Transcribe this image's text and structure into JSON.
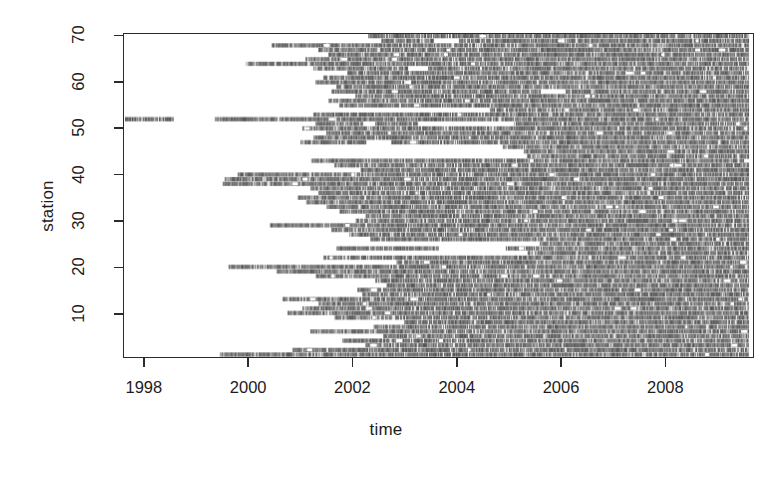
{
  "chart_data": {
    "type": "heatmap",
    "title": "",
    "xlabel": "time",
    "ylabel": "station",
    "xlim": [
      1997.6,
      2009.7
    ],
    "ylim": [
      0.5,
      70.5
    ],
    "grid": false,
    "legend": "none",
    "xticks": [
      1998,
      2000,
      2002,
      2004,
      2006,
      2008
    ],
    "xtick_labels": [
      "1998",
      "2000",
      "2002",
      "2004",
      "2006",
      "2008"
    ],
    "yticks": [
      10,
      20,
      30,
      40,
      50,
      60,
      70
    ],
    "ytick_labels": [
      "10",
      "20",
      "30",
      "40",
      "50",
      "60",
      "70"
    ],
    "fill_color": "#808080",
    "background_color": "#ffffff",
    "axis_color": "#2b2b2b",
    "n_stations": 70,
    "station_records": [
      {
        "station": 70,
        "segments": [
          [
            2002.3,
            2009.62
          ]
        ]
      },
      {
        "station": 69,
        "segments": [
          [
            2002.55,
            2003.55
          ],
          [
            2004.05,
            2009.62
          ]
        ]
      },
      {
        "station": 68,
        "segments": [
          [
            2000.45,
            2009.62
          ]
        ]
      },
      {
        "station": 67,
        "segments": [
          [
            2001.35,
            2009.62
          ]
        ]
      },
      {
        "station": 66,
        "segments": [
          [
            2001.55,
            2009.62
          ]
        ]
      },
      {
        "station": 65,
        "segments": [
          [
            2001.1,
            2009.62
          ]
        ]
      },
      {
        "station": 64,
        "segments": [
          [
            1999.95,
            2009.62
          ]
        ]
      },
      {
        "station": 63,
        "segments": [
          [
            2001.25,
            2003.05
          ],
          [
            2003.45,
            2009.62
          ]
        ]
      },
      {
        "station": 62,
        "segments": [
          [
            2001.9,
            2009.62
          ]
        ]
      },
      {
        "station": 61,
        "segments": [
          [
            2001.45,
            2009.62
          ]
        ]
      },
      {
        "station": 60,
        "segments": [
          [
            2001.3,
            2009.62
          ]
        ]
      },
      {
        "station": 59,
        "segments": [
          [
            2001.7,
            2009.62
          ]
        ]
      },
      {
        "station": 58,
        "segments": [
          [
            2001.6,
            2005.6
          ],
          [
            2006.1,
            2009.62
          ]
        ]
      },
      {
        "station": 57,
        "segments": [
          [
            2002.05,
            2009.62
          ]
        ]
      },
      {
        "station": 56,
        "segments": [
          [
            2001.55,
            2009.62
          ]
        ]
      },
      {
        "station": 55,
        "segments": [
          [
            2001.75,
            2009.62
          ]
        ]
      },
      {
        "station": 54,
        "segments": [
          [
            2004.65,
            2009.62
          ]
        ]
      },
      {
        "station": 53,
        "segments": [
          [
            2001.25,
            2009.62
          ]
        ]
      },
      {
        "station": 52,
        "segments": [
          [
            1997.62,
            1998.55
          ],
          [
            1999.35,
            2009.62
          ]
        ]
      },
      {
        "station": 51,
        "segments": [
          [
            2001.3,
            2002.2
          ],
          [
            2002.45,
            2003.25
          ],
          [
            2005.1,
            2009.62
          ]
        ]
      },
      {
        "station": 50,
        "segments": [
          [
            2001.05,
            2009.62
          ]
        ]
      },
      {
        "station": 49,
        "segments": [
          [
            2001.5,
            2009.62
          ]
        ]
      },
      {
        "station": 48,
        "segments": [
          [
            2001.25,
            2009.62
          ]
        ]
      },
      {
        "station": 47,
        "segments": [
          [
            2001.0,
            2002.25
          ],
          [
            2002.75,
            2009.62
          ]
        ]
      },
      {
        "station": 46,
        "segments": [
          [
            2004.9,
            2009.62
          ]
        ]
      },
      {
        "station": 45,
        "segments": [
          [
            2005.3,
            2009.62
          ]
        ]
      },
      {
        "station": 44,
        "segments": [
          [
            2005.35,
            2009.62
          ]
        ]
      },
      {
        "station": 43,
        "segments": [
          [
            2001.2,
            2009.62
          ]
        ]
      },
      {
        "station": 42,
        "segments": [
          [
            2001.65,
            2009.62
          ]
        ]
      },
      {
        "station": 41,
        "segments": [
          [
            2002.15,
            2009.62
          ]
        ]
      },
      {
        "station": 40,
        "segments": [
          [
            1999.8,
            2009.62
          ]
        ]
      },
      {
        "station": 39,
        "segments": [
          [
            1999.55,
            2009.62
          ]
        ]
      },
      {
        "station": 38,
        "segments": [
          [
            1999.5,
            2009.62
          ]
        ]
      },
      {
        "station": 37,
        "segments": [
          [
            2001.2,
            2009.62
          ]
        ]
      },
      {
        "station": 36,
        "segments": [
          [
            2001.35,
            2009.62
          ]
        ]
      },
      {
        "station": 35,
        "segments": [
          [
            2000.95,
            2009.62
          ]
        ]
      },
      {
        "station": 34,
        "segments": [
          [
            2001.1,
            2009.62
          ]
        ]
      },
      {
        "station": 33,
        "segments": [
          [
            2001.5,
            2009.62
          ]
        ]
      },
      {
        "station": 32,
        "segments": [
          [
            2001.75,
            2009.62
          ]
        ]
      },
      {
        "station": 31,
        "segments": [
          [
            2002.25,
            2009.62
          ]
        ]
      },
      {
        "station": 30,
        "segments": [
          [
            2002.05,
            2009.62
          ]
        ]
      },
      {
        "station": 29,
        "segments": [
          [
            2000.4,
            2009.62
          ]
        ]
      },
      {
        "station": 28,
        "segments": [
          [
            2001.6,
            2009.62
          ]
        ]
      },
      {
        "station": 27,
        "segments": [
          [
            2001.95,
            2009.62
          ]
        ]
      },
      {
        "station": 26,
        "segments": [
          [
            2002.35,
            2009.62
          ]
        ]
      },
      {
        "station": 25,
        "segments": [
          [
            2005.6,
            2009.62
          ]
        ]
      },
      {
        "station": 24,
        "segments": [
          [
            2001.7,
            2003.65
          ],
          [
            2004.95,
            2009.62
          ]
        ]
      },
      {
        "station": 23,
        "segments": [
          [
            2005.35,
            2009.62
          ]
        ]
      },
      {
        "station": 22,
        "segments": [
          [
            2001.45,
            2009.62
          ]
        ]
      },
      {
        "station": 21,
        "segments": [
          [
            2002.85,
            2009.62
          ]
        ]
      },
      {
        "station": 20,
        "segments": [
          [
            1999.6,
            2009.62
          ]
        ]
      },
      {
        "station": 19,
        "segments": [
          [
            2000.55,
            2009.62
          ]
        ]
      },
      {
        "station": 18,
        "segments": [
          [
            2001.3,
            2009.62
          ]
        ]
      },
      {
        "station": 17,
        "segments": [
          [
            2002.45,
            2009.62
          ]
        ]
      },
      {
        "station": 16,
        "segments": [
          [
            2002.65,
            2009.62
          ]
        ]
      },
      {
        "station": 15,
        "segments": [
          [
            2002.1,
            2009.62
          ]
        ]
      },
      {
        "station": 14,
        "segments": [
          [
            2002.2,
            2009.62
          ]
        ]
      },
      {
        "station": 13,
        "segments": [
          [
            2000.65,
            2009.62
          ]
        ]
      },
      {
        "station": 12,
        "segments": [
          [
            2001.35,
            2009.62
          ]
        ]
      },
      {
        "station": 11,
        "segments": [
          [
            2001.05,
            2009.62
          ]
        ]
      },
      {
        "station": 10,
        "segments": [
          [
            2000.75,
            2009.62
          ]
        ]
      },
      {
        "station": 9,
        "segments": [
          [
            2001.65,
            2009.62
          ]
        ]
      },
      {
        "station": 8,
        "segments": [
          [
            2003.0,
            2009.62
          ]
        ]
      },
      {
        "station": 7,
        "segments": [
          [
            2002.4,
            2009.62
          ]
        ]
      },
      {
        "station": 6,
        "segments": [
          [
            2001.2,
            2009.62
          ]
        ]
      },
      {
        "station": 5,
        "segments": [
          [
            2002.6,
            2009.62
          ]
        ]
      },
      {
        "station": 4,
        "segments": [
          [
            2001.8,
            2009.62
          ]
        ]
      },
      {
        "station": 3,
        "segments": [
          [
            2002.25,
            2009.62
          ]
        ]
      },
      {
        "station": 2,
        "segments": [
          [
            2000.85,
            2009.62
          ]
        ]
      },
      {
        "station": 1,
        "segments": [
          [
            1999.45,
            2009.62
          ]
        ]
      }
    ]
  }
}
